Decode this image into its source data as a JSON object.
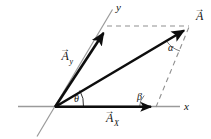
{
  "figure": {
    "type": "vector-diagram",
    "width": 211,
    "height": 139,
    "background_color": "#ffffff"
  },
  "colors": {
    "axis": "#9a9a9a",
    "vector": "#0d0d0d",
    "dashed": "#8f8f8f",
    "label": "#111111"
  },
  "axes": {
    "x_label": "x",
    "y_label": "y",
    "origin_label": "",
    "x_axis": {
      "x1": 18,
      "y1": 106.5,
      "x2": 180,
      "y2": 106.5
    },
    "y_axis": {
      "x1": 37,
      "y1": 136,
      "x2": 112,
      "y2": 10
    }
  },
  "vectors": [
    {
      "name": "A",
      "label": "A",
      "label_accent": "→",
      "from": {
        "x": 55,
        "y": 107
      },
      "to": {
        "x": 188,
        "y": 28
      },
      "label_pos": {
        "x": 195,
        "y": 19
      }
    },
    {
      "name": "Ay",
      "label": "A",
      "subscript": "y",
      "label_accent": "→",
      "from": {
        "x": 55,
        "y": 107
      },
      "to": {
        "x": 106,
        "y": 29
      },
      "label_pos": {
        "x": 62,
        "y": 60
      }
    },
    {
      "name": "Ax",
      "label": "A",
      "subscript": "X",
      "label_accent": "→",
      "from": {
        "x": 55,
        "y": 107
      },
      "to": {
        "x": 157,
        "y": 107
      },
      "label_pos": {
        "x": 106,
        "y": 122
      }
    }
  ],
  "angles": [
    {
      "name": "theta",
      "label": "θ",
      "pos": {
        "x": 75,
        "y": 101
      },
      "between": "Ax-and-A"
    },
    {
      "name": "alpha",
      "label": "α",
      "pos": {
        "x": 171,
        "y": 49
      },
      "between": "A-and-dashed-vertical"
    },
    {
      "name": "beta",
      "label": "β",
      "pos": {
        "x": 140,
        "y": 99
      },
      "between": "Ax-and-dashed-diagonal"
    }
  ],
  "dashed_lines": [
    {
      "name": "top-horizontal",
      "x1": 107,
      "y1": 26,
      "x2": 189,
      "y2": 26
    },
    {
      "name": "right-diagonal",
      "x1": 156,
      "y1": 107,
      "x2": 189,
      "y2": 27
    }
  ],
  "arcs": [
    {
      "name": "theta-arc",
      "cx": 55,
      "cy": 107,
      "r": 28
    },
    {
      "name": "alpha-arc",
      "cx": 188,
      "cy": 28,
      "r": 25
    },
    {
      "name": "beta-arc",
      "cx": 156,
      "cy": 107,
      "r": 17
    }
  ]
}
